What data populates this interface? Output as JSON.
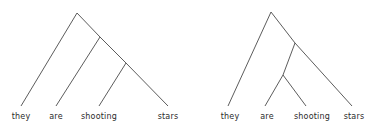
{
  "figure": {
    "type": "syntax-tree-pair",
    "sentence": "they are shooting stars",
    "background_color": "#ffffff",
    "line_color": "#4a4a4a",
    "text_color": "#2b2b2b"
  },
  "trees": [
    {
      "id": "left-tree",
      "reading": "they are shooting stars",
      "leaves": [
        {
          "label": "they",
          "x": 21,
          "text_x": 21,
          "text_y": 112
        },
        {
          "label": "are",
          "x": 56,
          "text_x": 56,
          "text_y": 112
        },
        {
          "label": "shooting",
          "x": 99,
          "text_x": 99,
          "text_y": 112
        },
        {
          "label": "stars",
          "x": 168,
          "text_x": 168,
          "text_y": 112
        }
      ],
      "nodes": [
        {
          "id": "n1",
          "x": 77,
          "y": 13
        },
        {
          "id": "n2",
          "x": 100,
          "y": 37
        },
        {
          "id": "n3",
          "x": 126,
          "y": 63
        }
      ],
      "edges": [
        {
          "from": [
            77,
            13
          ],
          "to": [
            21,
            106
          ]
        },
        {
          "from": [
            77,
            13
          ],
          "to": [
            100,
            37
          ]
        },
        {
          "from": [
            100,
            37
          ],
          "to": [
            56,
            106
          ]
        },
        {
          "from": [
            100,
            37
          ],
          "to": [
            126,
            63
          ]
        },
        {
          "from": [
            126,
            63
          ],
          "to": [
            99,
            106
          ]
        },
        {
          "from": [
            126,
            63
          ],
          "to": [
            168,
            106
          ]
        }
      ]
    },
    {
      "id": "right-tree",
      "reading": "they are shooting stars",
      "leaves": [
        {
          "label": "they",
          "x": 228,
          "text_x": 230,
          "text_y": 112
        },
        {
          "label": "are",
          "x": 265,
          "text_x": 267,
          "text_y": 112
        },
        {
          "label": "shooting",
          "x": 306,
          "text_x": 312,
          "text_y": 112
        },
        {
          "label": "stars",
          "x": 352,
          "text_x": 354,
          "text_y": 112
        }
      ],
      "nodes": [
        {
          "id": "m1",
          "x": 271,
          "y": 12
        },
        {
          "id": "m2",
          "x": 295,
          "y": 43
        },
        {
          "id": "m3",
          "x": 283,
          "y": 75
        }
      ],
      "edges": [
        {
          "from": [
            271,
            12
          ],
          "to": [
            228,
            106
          ]
        },
        {
          "from": [
            271,
            12
          ],
          "to": [
            295,
            43
          ]
        },
        {
          "from": [
            295,
            43
          ],
          "to": [
            283,
            75
          ]
        },
        {
          "from": [
            295,
            43
          ],
          "to": [
            352,
            106
          ]
        },
        {
          "from": [
            283,
            75
          ],
          "to": [
            265,
            106
          ]
        },
        {
          "from": [
            283,
            75
          ],
          "to": [
            306,
            106
          ]
        }
      ]
    }
  ]
}
